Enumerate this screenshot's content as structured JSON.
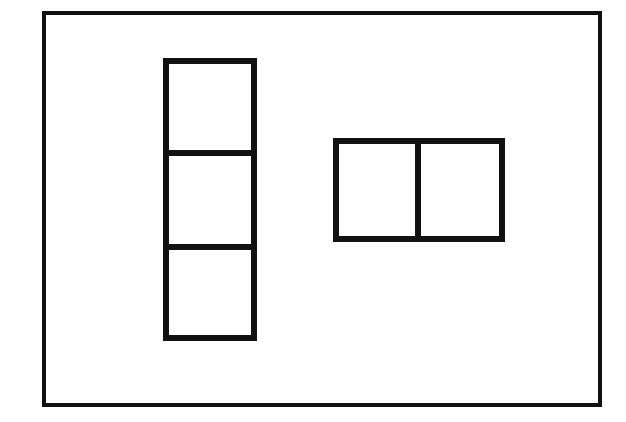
{
  "canvas": {
    "width": 626,
    "height": 422,
    "background_color": "#ffffff",
    "ink_color": "#111111",
    "title": "Polyomino line diagram"
  },
  "frame": {
    "name": "outer-frame",
    "x": 42,
    "y": 11,
    "width": 560,
    "height": 396,
    "stroke_width": 4,
    "stroke_color": "#111111",
    "fill": "none"
  },
  "shapes": [
    {
      "id": "vertical-tromino",
      "label": "Vertical column of three squares",
      "orientation": "vertical",
      "cell_count": 3,
      "x": 163,
      "y": 58,
      "width": 94,
      "height": 283,
      "stroke_width": 6,
      "stroke_color": "#111111",
      "fill": "#ffffff",
      "dividers": [
        {
          "id": "v-divider-1",
          "axis": "horizontal",
          "position": 153
        },
        {
          "id": "v-divider-2",
          "axis": "horizontal",
          "position": 247
        }
      ],
      "cells": [
        {
          "id": "vertical-cell-1",
          "index": 1,
          "x": 163,
          "y": 58,
          "width": 94,
          "height": 95
        },
        {
          "id": "vertical-cell-2",
          "index": 2,
          "x": 163,
          "y": 153,
          "width": 94,
          "height": 94
        },
        {
          "id": "vertical-cell-3",
          "index": 3,
          "x": 163,
          "y": 247,
          "width": 94,
          "height": 94
        }
      ]
    },
    {
      "id": "horizontal-domino",
      "label": "Horizontal pair of two squares",
      "orientation": "horizontal",
      "cell_count": 2,
      "x": 333,
      "y": 138,
      "width": 172,
      "height": 104,
      "stroke_width": 6,
      "stroke_color": "#111111",
      "fill": "#ffffff",
      "dividers": [
        {
          "id": "h-divider-1",
          "axis": "vertical",
          "position": 418
        }
      ],
      "cells": [
        {
          "id": "horizontal-cell-1",
          "index": 1,
          "x": 333,
          "y": 138,
          "width": 85,
          "height": 104
        },
        {
          "id": "horizontal-cell-2",
          "index": 2,
          "x": 418,
          "y": 138,
          "width": 87,
          "height": 104
        }
      ]
    }
  ]
}
